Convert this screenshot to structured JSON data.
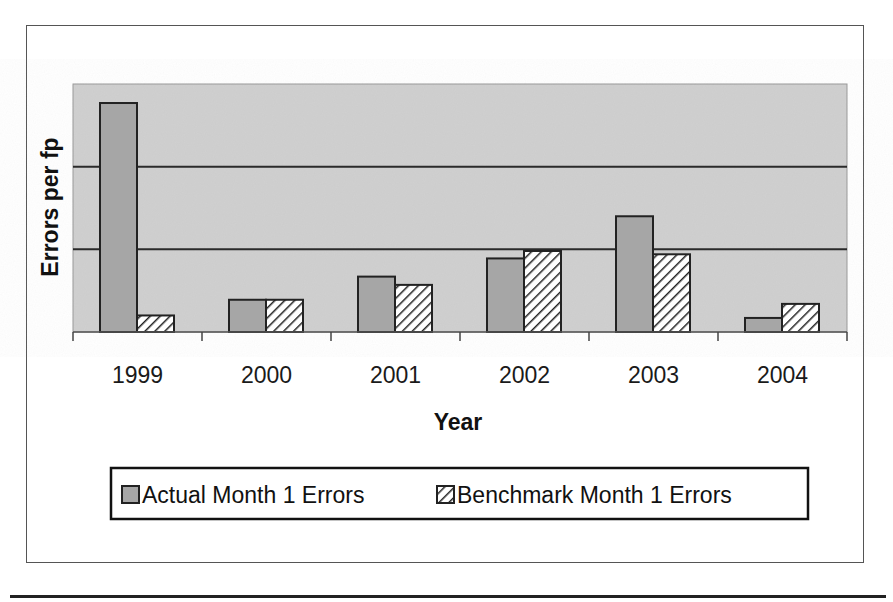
{
  "chart_data": {
    "type": "bar",
    "title": "",
    "xlabel": "Year",
    "ylabel": "Errors per fp",
    "categories": [
      "1999",
      "2000",
      "2001",
      "2002",
      "2003",
      "2004"
    ],
    "series": [
      {
        "name": "Actual Month 1 Errors",
        "style": "solid-gray",
        "color": "#a6a6a6",
        "values": [
          2.77,
          0.39,
          0.67,
          0.89,
          1.4,
          0.17
        ]
      },
      {
        "name": "Benchmark Month 1 Errors",
        "style": "diagonal-hatch",
        "color": "#ffffff",
        "values": [
          0.2,
          0.39,
          0.57,
          0.98,
          0.94,
          0.34
        ]
      }
    ],
    "ylim": [
      0,
      3
    ],
    "y_gridlines": [
      1,
      2
    ],
    "y_tick_labels_shown": false,
    "grid": true,
    "legend_position": "bottom",
    "plot_background": "#d0d0d0"
  }
}
